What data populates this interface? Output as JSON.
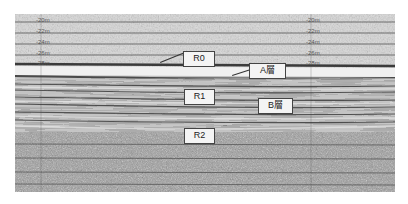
{
  "figure": {
    "type": "sub-bottom seismic profile",
    "depth_labels_left": [
      "-20m",
      "-22m",
      "-24m",
      "-26m",
      "-28m"
    ],
    "depth_labels_right": [
      "-20m",
      "-22m",
      "-24m",
      "-26m",
      "-28m"
    ],
    "annotations": [
      {
        "id": "R0",
        "label": "R0"
      },
      {
        "id": "A",
        "label": "A層"
      },
      {
        "id": "R1",
        "label": "R1"
      },
      {
        "id": "B",
        "label": "B層"
      },
      {
        "id": "R2",
        "label": "R2"
      }
    ],
    "colors": {
      "background": "#ffffff",
      "profile_light": "#d6d6d6",
      "profile_dark": "#3a3a3a",
      "label_box": "#f4f4f4"
    }
  }
}
